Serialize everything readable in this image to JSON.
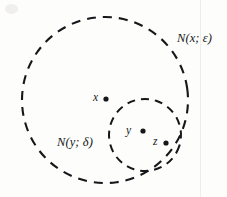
{
  "figure": {
    "background_color": "#fdfdfc",
    "ink_color": "#15171a",
    "circles": [
      {
        "name": "outer-neighborhood",
        "label": "N(x; ε)",
        "center_x": 105,
        "center_y": 100,
        "radius": 83,
        "stroke_style": "dashed",
        "stroke_width": 2.1,
        "dash_pattern": "9 7"
      },
      {
        "name": "inner-neighborhood",
        "label": "N(y; δ)",
        "center_x": 145,
        "center_y": 135,
        "radius": 36,
        "stroke_style": "dashed",
        "stroke_width": 2.0,
        "dash_pattern": "8 6"
      }
    ],
    "points": [
      {
        "name": "point-x",
        "label": "x",
        "x": 106,
        "y": 99,
        "dot_radius": 2.6
      },
      {
        "name": "point-y",
        "label": "y",
        "x": 143,
        "y": 131,
        "dot_radius": 2.6
      },
      {
        "name": "point-z",
        "label": "z",
        "x": 166,
        "y": 143,
        "dot_radius": 2.6
      }
    ],
    "labels": {
      "outer_set": "N(x; ε)",
      "inner_set": "N(y; δ)",
      "point_x": "x",
      "point_y": "y",
      "point_z": "z"
    }
  }
}
